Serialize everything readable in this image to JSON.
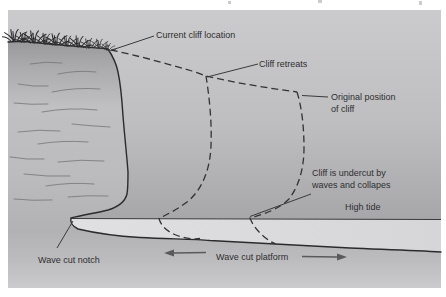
{
  "figure": {
    "type": "coastal-erosion-cliff-retreat-cross-section",
    "labels": {
      "current_cliff_location": "Current cliff location",
      "cliff_retreats": "Cliff retreats",
      "original_position_line1": "Original position",
      "original_position_line2": "of cliff",
      "undercut_line1": "Cliff is undercut by",
      "undercut_line2": "waves and collapes",
      "high_tide": "High tide",
      "wave_cut_notch": "Wave cut notch",
      "wave_cut_platform": "Wave cut platform"
    },
    "colors": {
      "page_background": "#ffffff",
      "panel_top": "#cbcbcd",
      "panel_above_tide": "#a7a7a9",
      "platform_band": "#dbdbdd",
      "lower_band": "#aeaeb0",
      "lower_bottom": "#cbcbcd",
      "outline": "#2b2b2d",
      "dashed_line": "#333335",
      "pointer_line": "#3a3a3c",
      "text": "#2e2e30",
      "arrow": "#5a5a5c",
      "strata": "#737376"
    },
    "arrows": [
      {
        "name": "platform-arrow-left",
        "direction": "left"
      },
      {
        "name": "platform-arrow-right",
        "direction": "right"
      }
    ]
  }
}
